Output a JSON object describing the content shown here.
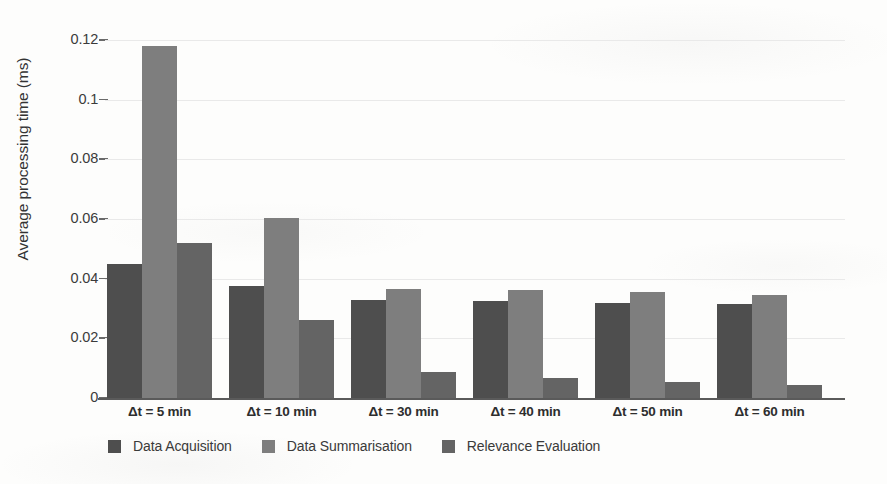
{
  "chart_data": {
    "type": "bar",
    "title": "",
    "xlabel": "",
    "ylabel": "Average processing time (ms)",
    "categories": [
      "Δt = 5 min",
      "Δt = 10 min",
      "Δt = 30 min",
      "Δt = 40 min",
      "Δt =  50 min",
      "Δt = 60 min"
    ],
    "series": [
      {
        "name": "Data Acquisition",
        "color": "#4e4e4e",
        "values": [
          0.045,
          0.0375,
          0.0327,
          0.0325,
          0.032,
          0.0315
        ]
      },
      {
        "name": "Data Summarisation",
        "color": "#7e7e7e",
        "values": [
          0.118,
          0.0605,
          0.0365,
          0.0363,
          0.0355,
          0.0345
        ]
      },
      {
        "name": "Relevance Evaluation",
        "color": "#646464",
        "values": [
          0.052,
          0.026,
          0.0088,
          0.0068,
          0.0055,
          0.0045
        ]
      }
    ],
    "ylim": [
      0,
      0.12
    ],
    "ytick_labels": [
      "0.12",
      "0.1",
      "0.08",
      "0.06",
      "0.04",
      "0.02",
      "0"
    ],
    "ytick_values": [
      0.12,
      0.1,
      0.08,
      0.06,
      0.04,
      0.02,
      0
    ],
    "grid": true,
    "grid_color": "#e9e9e9",
    "legend_position": "bottom-left",
    "axis_color": "#5a5a5a",
    "background_color": "#fdfdfc"
  },
  "legend": {
    "items": [
      {
        "label": "Data Acquisition",
        "color": "#4e4e4e"
      },
      {
        "label": "Data Summarisation",
        "color": "#7e7e7e"
      },
      {
        "label": "Relevance Evaluation",
        "color": "#646464"
      }
    ]
  },
  "artifacts": {
    "ghost_texts": [
      "",
      "",
      "",
      ""
    ]
  }
}
